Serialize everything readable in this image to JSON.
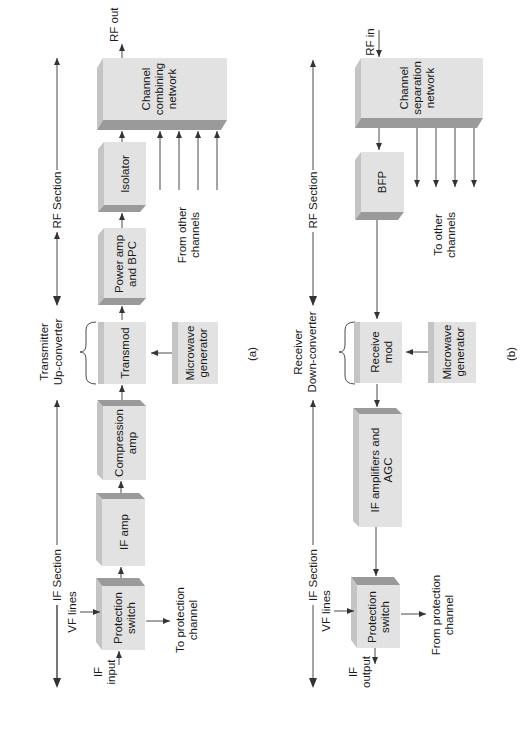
{
  "figure": {
    "orientation": "rotated-90-ccw",
    "panels": [
      {
        "id": "a",
        "caption": "(a)",
        "sections": {
          "rf": "RF Section",
          "if": "IF Section",
          "converter": [
            "Transmitter",
            "Up-converter"
          ]
        },
        "blocks": {
          "combining": [
            "Channel",
            "combining",
            "network"
          ],
          "isolator": [
            "Isolator"
          ],
          "power_amp": [
            "Power amp",
            "and BPC"
          ],
          "transmod": [
            "Transmod"
          ],
          "microwave": [
            "Microwave",
            "generator"
          ],
          "compression": [
            "Compression",
            "amp"
          ],
          "if_amp": [
            "IF amp"
          ],
          "protection": [
            "Protection",
            "switch"
          ]
        },
        "labels": {
          "rf_out": "RF out",
          "from_other": [
            "From other",
            "channels"
          ],
          "vf_lines": "VF lines",
          "if_input": [
            "IF",
            "input"
          ],
          "to_protection": [
            "To protection",
            "channel"
          ]
        }
      },
      {
        "id": "b",
        "caption": "(b)",
        "sections": {
          "rf": "RF Section",
          "if": "IF Section",
          "converter": [
            "Receiver",
            "Down-converter"
          ]
        },
        "blocks": {
          "separation": [
            "Channel",
            "separation",
            "network"
          ],
          "bfp": [
            "BFP"
          ],
          "receive_mod": [
            "Receive",
            "mod"
          ],
          "microwave": [
            "Microwave",
            "generator"
          ],
          "if_amps": [
            "IF amplifiers and",
            "AGC"
          ],
          "protection": [
            "Protection",
            "switch"
          ]
        },
        "labels": {
          "rf_in": "RF in",
          "to_other": [
            "To other",
            "channels"
          ],
          "vf_lines": "VF lines",
          "if_output": [
            "IF",
            "output"
          ],
          "from_protection": [
            "From protection",
            "channel"
          ]
        }
      }
    ]
  }
}
